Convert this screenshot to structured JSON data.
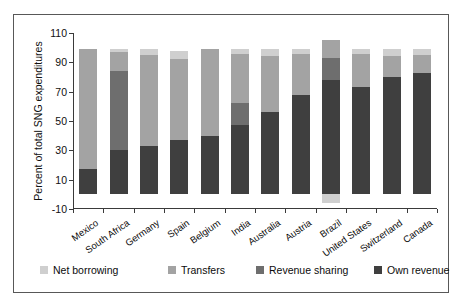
{
  "chart_data": {
    "type": "bar",
    "stacked": true,
    "title": "",
    "xlabel": "",
    "ylabel": "Percent of total SNG expenditures",
    "ylim": [
      -10,
      110
    ],
    "yticks": [
      -10,
      10,
      30,
      50,
      70,
      90,
      110
    ],
    "ytick_labels": [
      "-10",
      "10",
      "30",
      "50",
      "70",
      "90",
      "110"
    ],
    "grid": false,
    "legend_position": "bottom",
    "categories": [
      "Mexico",
      "South Africa",
      "Germany",
      "Spain",
      "Belgium",
      "India",
      "Australia",
      "Austria",
      "Brazil",
      "United States",
      "Switzerland",
      "Canada"
    ],
    "series": [
      {
        "name": "Own revenue",
        "color": "#3f3f3f",
        "values": [
          17,
          30,
          33,
          37,
          40,
          47,
          56,
          68,
          78,
          73,
          80,
          83
        ]
      },
      {
        "name": "Revenue sharing",
        "color": "#6e6e6e",
        "values": [
          0,
          54,
          0,
          0,
          0,
          15,
          0,
          0,
          15,
          0,
          0,
          0
        ]
      },
      {
        "name": "Transfers",
        "color": "#a3a3a3",
        "values": [
          82,
          13,
          62,
          55,
          59,
          34,
          38,
          28,
          12,
          23,
          14,
          12
        ]
      },
      {
        "name": "Net borrowing",
        "color": "#cfcfcf",
        "values": [
          0,
          2,
          4,
          6,
          0,
          3,
          5,
          3,
          -6,
          3,
          5,
          4
        ]
      }
    ],
    "totals": [
      99,
      99,
      99,
      98,
      99,
      99,
      99,
      99,
      105,
      99,
      99,
      99
    ],
    "legend_entries": [
      {
        "label": "Net borrowing",
        "color": "#cfcfcf"
      },
      {
        "label": "Transfers",
        "color": "#a3a3a3"
      },
      {
        "label": "Revenue sharing",
        "color": "#6e6e6e"
      },
      {
        "label": "Own revenue",
        "color": "#3f3f3f"
      }
    ]
  }
}
